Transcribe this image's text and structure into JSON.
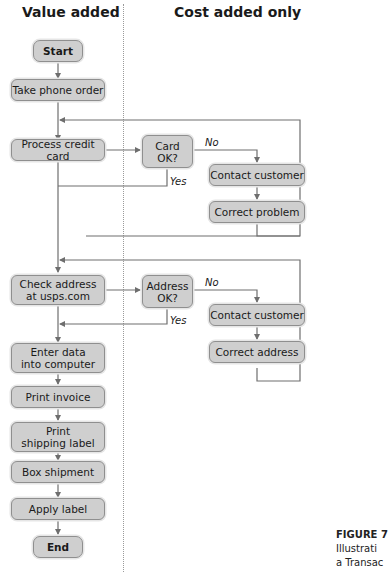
{
  "headings": {
    "value_added": "Value added",
    "cost_added_only": "Cost added only"
  },
  "nodes": {
    "start": "Start",
    "take_phone_order": "Take phone order",
    "process_credit_card": "Process credit card",
    "card_ok": "Card\nOK?",
    "contact_customer_1": "Contact customer",
    "correct_problem": "Correct problem",
    "check_address": "Check address\nat usps.com",
    "address_ok": "Address\nOK?",
    "contact_customer_2": "Contact customer",
    "correct_address": "Correct address",
    "enter_data": "Enter data\ninto computer",
    "print_invoice": "Print invoice",
    "print_shipping_label": "Print\nshipping label",
    "box_shipment": "Box shipment",
    "apply_label": "Apply label",
    "end": "End"
  },
  "edge_labels": {
    "card_no": "No",
    "card_yes": "Yes",
    "address_no": "No",
    "address_yes": "Yes"
  },
  "caption": {
    "figure": "FIGURE 7",
    "line1": "Illustrati",
    "line2": "a Transac"
  },
  "colors": {
    "box_fill": "#cfcfcf",
    "line": "#6e6e6e"
  }
}
